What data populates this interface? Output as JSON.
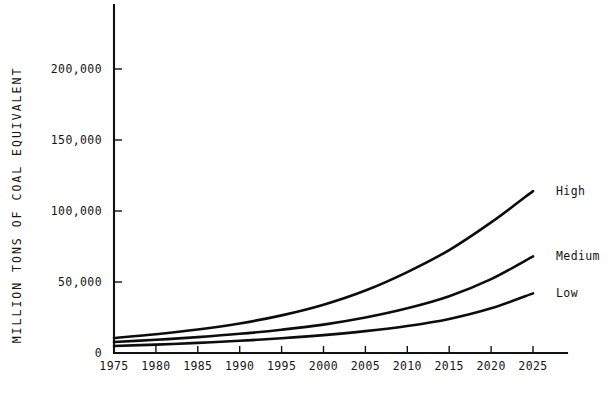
{
  "chart_data": {
    "type": "line",
    "title": "",
    "subtitle": "",
    "xlabel": "",
    "ylabel": "MILLION TONS OF COAL EQUIVALENT",
    "xlim": [
      1975,
      2025
    ],
    "ylim": [
      0,
      235000
    ],
    "grid": false,
    "legend_position": "right-of-plot-line-end",
    "x_ticks": [
      "1975",
      "1980",
      "1985",
      "1990",
      "1995",
      "2000",
      "2005",
      "2010",
      "2015",
      "2020",
      "2025"
    ],
    "x": [
      1975,
      1980,
      1985,
      1990,
      1995,
      2000,
      2005,
      2010,
      2015,
      2020,
      2025
    ],
    "y_ticks": [
      "0",
      "50,000",
      "100,000",
      "150,000",
      "200,000"
    ],
    "y_tick_values": [
      0,
      50000,
      100000,
      150000,
      200000
    ],
    "series": [
      {
        "name": "High",
        "label": "High",
        "values": [
          10600,
          13200,
          16500,
          20800,
          26500,
          34000,
          44000,
          57000,
          72500,
          92000,
          114000
        ]
      },
      {
        "name": "Medium",
        "label": "Medium",
        "values": [
          7700,
          9300,
          11200,
          13500,
          16400,
          20000,
          25000,
          31500,
          40000,
          52000,
          68000
        ]
      },
      {
        "name": "Low",
        "label": "Low",
        "values": [
          4900,
          5900,
          7100,
          8600,
          10400,
          12600,
          15400,
          19000,
          24000,
          31500,
          42000
        ]
      }
    ]
  }
}
